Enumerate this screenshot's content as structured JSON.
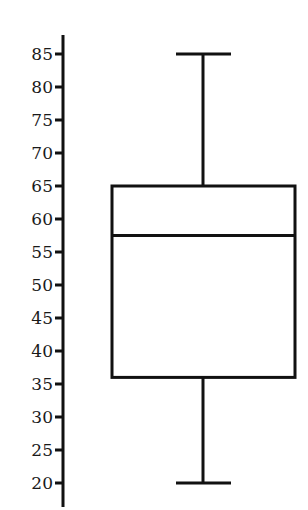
{
  "chart_data": {
    "type": "box",
    "title": "",
    "xlabel": "",
    "ylabel": "",
    "orientation": "vertical",
    "ylim": [
      20,
      85
    ],
    "y_ticks": [
      20,
      25,
      30,
      35,
      40,
      45,
      50,
      55,
      60,
      65,
      70,
      75,
      80,
      85
    ],
    "y_tick_labels": [
      "20",
      "25",
      "30",
      "35",
      "40",
      "45",
      "50",
      "55",
      "60",
      "65",
      "70",
      "75",
      "80",
      "85"
    ],
    "grid": false,
    "legend": null,
    "series": [
      {
        "name": "",
        "min": 20,
        "q1": 36,
        "median": 57.5,
        "q3": 65,
        "max": 85
      }
    ],
    "colors": {
      "stroke": "#111111",
      "fill": "#ffffff"
    }
  }
}
